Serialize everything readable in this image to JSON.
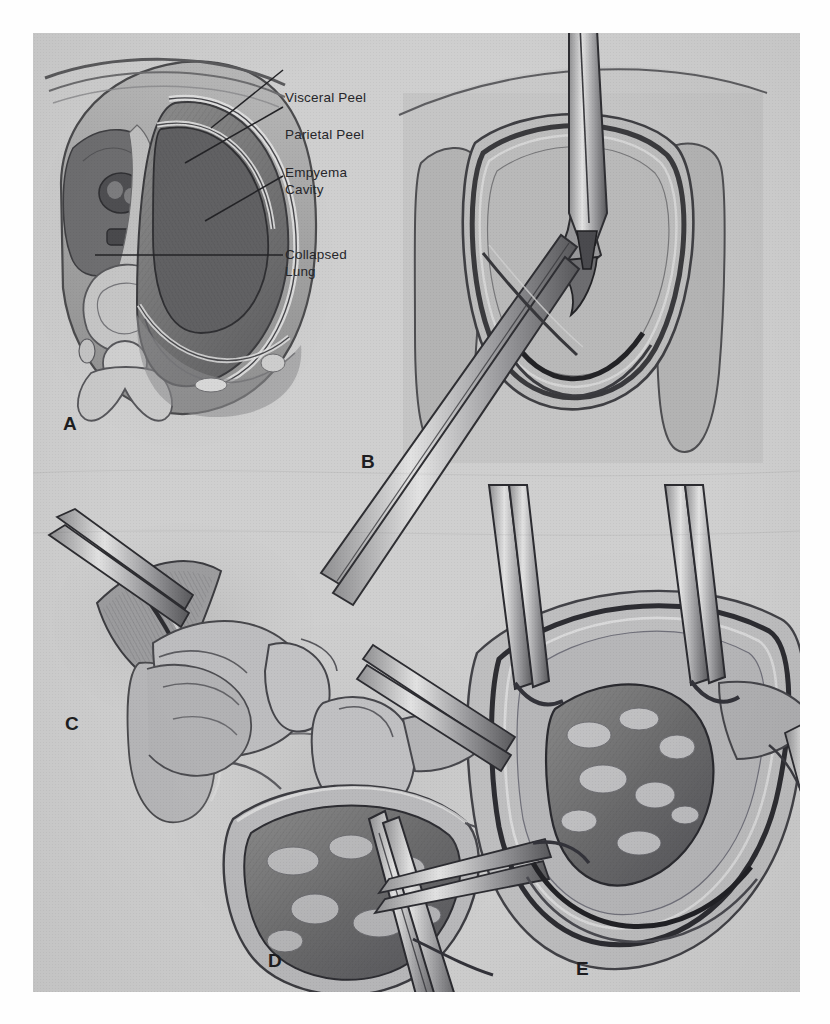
{
  "figure": {
    "kind": "medical-illustration-plate",
    "caption_labels": {
      "visceral_peel": "Visceral Peel",
      "parietal_peel": "Parietal Peel",
      "empyema_line1": "Empyema",
      "empyema_line2": "Cavity",
      "collapsed_line1": "Collapsed",
      "collapsed_line2": "Lung"
    },
    "panels": [
      {
        "id": "A",
        "letter": "A",
        "title": "Cross-section of thorax showing empyema cavity"
      },
      {
        "id": "B",
        "letter": "B",
        "title": "Thoracotomy with forceps grasping parietal peel"
      },
      {
        "id": "C",
        "letter": "C",
        "title": "Close-up of peel elevation"
      },
      {
        "id": "D",
        "letter": "D",
        "title": "Hand retraction exposing lung surface"
      },
      {
        "id": "E",
        "letter": "E",
        "title": "Decorticated lung with clamps on peel edges"
      }
    ],
    "colors": {
      "plate_background": "#cfcfcf",
      "page_background": "#ffffff",
      "ink": "#26262a",
      "mid_tone": "#9a9a9a",
      "dark_tone": "#5c5c5e"
    }
  }
}
